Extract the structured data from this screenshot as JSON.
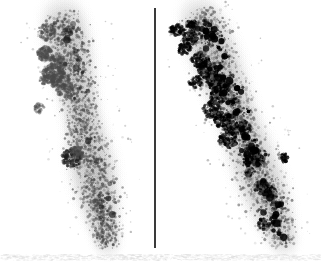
{
  "figure": {
    "title": "Autoradiographic in situ hybridization comparison",
    "background_color": "#ffffff",
    "width": 321,
    "height": 262,
    "divider": {
      "name": "panel-divider",
      "orientation": "vertical",
      "color": "#3a3a3a",
      "x": 154,
      "y_top": 8,
      "y_bottom": 248,
      "thickness": 2
    },
    "panels": [
      {
        "id": "left",
        "label": "",
        "description": "Elongated diagonal tissue section with moderate gray silver-grain labeling",
        "grain_color": "#4a4a4a",
        "cluster_color": "#1c1c1c",
        "intensity": "moderate",
        "grain_count": 1700,
        "cluster_count": 26,
        "seed": 20394,
        "axis": {
          "x_top": 62,
          "y_top": 14,
          "x_bottom": 108,
          "y_bottom": 246
        },
        "half_width_profile": [
          26,
          30,
          29,
          27,
          25,
          24,
          27,
          30,
          29,
          25,
          21,
          17
        ],
        "hot_spots": [
          {
            "cx": 47,
            "cy": 32,
            "r": 9,
            "darkness": 0.72
          },
          {
            "cx": 45,
            "cy": 54,
            "r": 8,
            "darkness": 0.68
          },
          {
            "cx": 44,
            "cy": 52,
            "r": 7,
            "darkness": 0.7
          },
          {
            "cx": 53,
            "cy": 74,
            "r": 11,
            "darkness": 0.82
          },
          {
            "cx": 58,
            "cy": 62,
            "r": 9,
            "darkness": 0.7
          },
          {
            "cx": 60,
            "cy": 80,
            "r": 10,
            "darkness": 0.76
          },
          {
            "cx": 66,
            "cy": 90,
            "r": 9,
            "darkness": 0.72
          },
          {
            "cx": 45,
            "cy": 79,
            "r": 6,
            "darkness": 0.66
          },
          {
            "cx": 72,
            "cy": 158,
            "r": 10,
            "darkness": 0.9
          },
          {
            "cx": 78,
            "cy": 152,
            "r": 7,
            "darkness": 0.74
          },
          {
            "cx": 98,
            "cy": 203,
            "r": 6,
            "darkness": 0.72
          },
          {
            "cx": 39,
            "cy": 108,
            "r": 5,
            "darkness": 0.62
          }
        ]
      },
      {
        "id": "right",
        "label": "",
        "description": "Elongated diagonal tissue section with intense black silver-grain labeling concentrated in a central band",
        "grain_color": "#5a5a5a",
        "cluster_color": "#000000",
        "intensity": "intense",
        "grain_count": 1750,
        "cluster_count": 78,
        "seed": 77312,
        "axis": {
          "x_top": 198,
          "y_top": 12,
          "x_bottom": 285,
          "y_bottom": 245
        },
        "half_width_profile": [
          24,
          30,
          31,
          30,
          28,
          27,
          28,
          30,
          30,
          28,
          23,
          18
        ],
        "hot_spots": [
          {
            "cx": 176,
            "cy": 30,
            "r": 7,
            "darkness": 1.0
          },
          {
            "cx": 192,
            "cy": 26,
            "r": 6,
            "darkness": 0.95
          },
          {
            "cx": 190,
            "cy": 38,
            "r": 8,
            "darkness": 1.0
          },
          {
            "cx": 184,
            "cy": 48,
            "r": 7,
            "darkness": 0.95
          },
          {
            "cx": 200,
            "cy": 60,
            "r": 9,
            "darkness": 1.0
          },
          {
            "cx": 208,
            "cy": 70,
            "r": 10,
            "darkness": 1.0
          },
          {
            "cx": 215,
            "cy": 80,
            "r": 9,
            "darkness": 1.0
          },
          {
            "cx": 222,
            "cy": 88,
            "r": 8,
            "darkness": 1.0
          },
          {
            "cx": 196,
            "cy": 82,
            "r": 7,
            "darkness": 0.95
          },
          {
            "cx": 218,
            "cy": 96,
            "r": 8,
            "darkness": 1.0
          },
          {
            "cx": 212,
            "cy": 110,
            "r": 9,
            "darkness": 1.0
          },
          {
            "cx": 222,
            "cy": 120,
            "r": 8,
            "darkness": 1.0
          },
          {
            "cx": 232,
            "cy": 128,
            "r": 8,
            "darkness": 1.0
          },
          {
            "cx": 228,
            "cy": 140,
            "r": 9,
            "darkness": 1.0
          },
          {
            "cx": 244,
            "cy": 126,
            "r": 6,
            "darkness": 0.95
          },
          {
            "cx": 252,
            "cy": 155,
            "r": 9,
            "darkness": 1.0
          },
          {
            "cx": 258,
            "cy": 160,
            "r": 7,
            "darkness": 1.0
          },
          {
            "cx": 284,
            "cy": 158,
            "r": 5,
            "darkness": 1.0
          },
          {
            "cx": 262,
            "cy": 188,
            "r": 8,
            "darkness": 1.0
          },
          {
            "cx": 270,
            "cy": 192,
            "r": 7,
            "darkness": 1.0
          },
          {
            "cx": 276,
            "cy": 205,
            "r": 5,
            "darkness": 0.95
          },
          {
            "cx": 264,
            "cy": 224,
            "r": 6,
            "darkness": 1.0
          },
          {
            "cx": 250,
            "cy": 172,
            "r": 5,
            "darkness": 0.9
          },
          {
            "cx": 234,
            "cy": 102,
            "r": 5,
            "darkness": 0.9
          }
        ]
      }
    ],
    "bottom_artifact": {
      "name": "scan-noise-strip",
      "description": "faint horizontal scanner noise along the bottom edge",
      "color": "#d8d8d8",
      "y": 252,
      "height": 6
    }
  }
}
